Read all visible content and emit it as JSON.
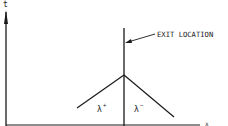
{
  "diagram": {
    "axis_t_label": "t",
    "exit_label": "EXIT LOCATION",
    "lambda_plus": "λ",
    "lambda_plus_sup": "+",
    "lambda_minus": "λ",
    "lambda_minus_sup": "−",
    "x_axis_label": "x",
    "line_color": "#1a1a1a"
  }
}
